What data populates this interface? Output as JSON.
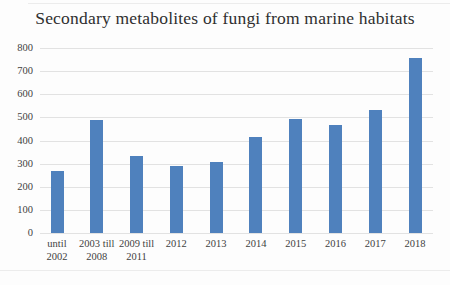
{
  "chart_data": {
    "type": "bar",
    "title": "Secondary metabolites of fungi from marine habitats",
    "categories": [
      "until\n2002",
      "2003 till\n2008",
      "2009 till\n2011",
      "2012",
      "2013",
      "2014",
      "2015",
      "2016",
      "2017",
      "2018"
    ],
    "values": [
      270,
      490,
      335,
      290,
      305,
      415,
      495,
      465,
      530,
      755
    ],
    "xlabel": "",
    "ylabel": "",
    "ylim": [
      0,
      800
    ],
    "yticks": [
      0,
      100,
      200,
      300,
      400,
      500,
      600,
      700,
      800
    ],
    "grid": true,
    "legend_position": "none",
    "bar_color": "#4f81bd",
    "gridline_color": "#e2e2e2",
    "text_color": "#3f3f3f",
    "title_color": "#2f2f2f"
  }
}
